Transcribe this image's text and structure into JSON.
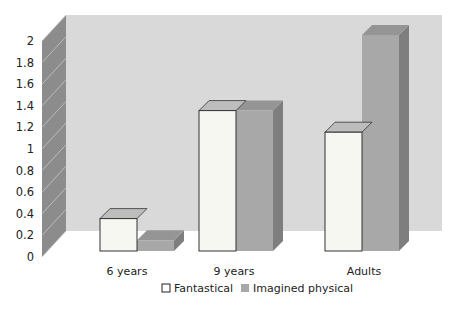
{
  "chart_data": {
    "type": "bar",
    "style": "3d-clustered",
    "title": "",
    "xlabel": "",
    "ylabel": "",
    "categories": [
      "6 years",
      "9 years",
      "Adults"
    ],
    "series": [
      {
        "name": "Fantastical",
        "values": [
          0.3,
          1.3,
          1.1
        ],
        "color": "#f7f7f2"
      },
      {
        "name": "Imagined physical",
        "values": [
          0.1,
          1.3,
          2.0
        ],
        "color": "#a8a8a8"
      }
    ],
    "yticks": [
      "0",
      "0.2",
      "0.4",
      "0.6",
      "0.8",
      "1",
      "1.2",
      "1.4",
      "1.6",
      "1.8",
      "2"
    ],
    "ylim": [
      0,
      2
    ],
    "grid": true,
    "legend_position": "bottom"
  },
  "colors": {
    "back_wall": "#d9d9d9",
    "side_wall": "#8c8c8c",
    "floor": "#ffffff",
    "fantastical_front": "#f7f7f2",
    "fantastical_top": "#bdbdbd",
    "imagined_front": "#a8a8a8",
    "imagined_side": "#7e7e7e",
    "imagined_top": "#959595"
  }
}
